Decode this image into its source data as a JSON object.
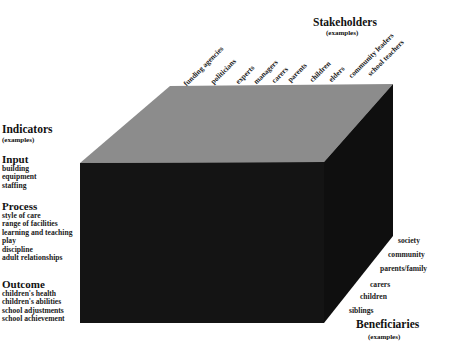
{
  "stakeholders": {
    "title": "Stakeholders",
    "subtitle": "(examples)",
    "items": [
      "funding agencies",
      "politicians",
      "experts",
      "managers",
      "carers",
      "parents",
      "children",
      "elders",
      "community leaders",
      "school teachers"
    ]
  },
  "indicators": {
    "title": "Indicators",
    "subtitle": "(examples)",
    "sections": [
      {
        "title": "Input",
        "items": [
          "building",
          "equipment",
          "staffing"
        ]
      },
      {
        "title": "Process",
        "items": [
          "style of care",
          "range of facilities",
          "learning and teaching",
          "play",
          "discipline",
          "adult relationships"
        ]
      },
      {
        "title": "Outcome",
        "items": [
          "children's health",
          "children's abilities",
          "school adjustments",
          "school achievement"
        ]
      }
    ]
  },
  "beneficiaries": {
    "title": "Beneficiaries",
    "subtitle": "(examples)",
    "items": [
      "society",
      "community",
      "parents/family",
      "carers",
      "children",
      "siblings"
    ]
  },
  "colors": {
    "top_face": "#8c8c8c",
    "front_face": "#141414",
    "side_face": "#0f0f0f"
  }
}
